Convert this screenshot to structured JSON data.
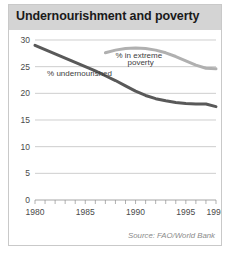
{
  "panel": {
    "title": "Undernourishment and poverty",
    "source": "Source: FAO/World Bank"
  },
  "chart_data": {
    "type": "line",
    "title": "Undernourishment and poverty",
    "xlabel": "",
    "ylabel": "",
    "xlim": [
      1980,
      1998
    ],
    "ylim": [
      0,
      30
    ],
    "yticks": [
      0,
      5,
      10,
      15,
      20,
      25,
      30
    ],
    "ytick_labels": [
      "0",
      "5",
      "10",
      "15",
      "20",
      "25",
      "30"
    ],
    "xticks": [
      1980,
      1985,
      1990,
      1995,
      1998
    ],
    "xtick_labels": [
      "1980",
      "1985",
      "1990",
      "1995",
      "1998"
    ],
    "minor_xticks": [
      1980,
      1981,
      1982,
      1983,
      1984,
      1985,
      1986,
      1987,
      1988,
      1989,
      1990,
      1991,
      1992,
      1993,
      1994,
      1995,
      1996,
      1997,
      1998
    ],
    "grid": "horizontal",
    "legend": "inline-labels",
    "series": [
      {
        "name": "% undernourished",
        "label": "% undernourished",
        "color": "#595959",
        "x": [
          1980,
          1981,
          1982,
          1983,
          1984,
          1985,
          1986,
          1987,
          1988,
          1989,
          1990,
          1991,
          1992,
          1993,
          1994,
          1995,
          1996,
          1997,
          1998
        ],
        "values": [
          29.0,
          28.2,
          27.4,
          26.6,
          25.8,
          25.0,
          24.2,
          23.3,
          22.4,
          21.4,
          20.4,
          19.6,
          19.0,
          18.6,
          18.3,
          18.1,
          18.0,
          18.0,
          17.5
        ]
      },
      {
        "name": "% in extreme poverty",
        "label": "% in extreme poverty",
        "color": "#b0b0b0",
        "x": [
          1987,
          1988,
          1989,
          1990,
          1991,
          1992,
          1993,
          1994,
          1995,
          1996,
          1997,
          1998
        ],
        "values": [
          27.6,
          28.1,
          28.4,
          28.5,
          28.4,
          28.1,
          27.6,
          26.9,
          26.1,
          25.3,
          24.7,
          24.6
        ]
      }
    ],
    "annotations": [
      {
        "text": "% in extreme",
        "x": 1988.0,
        "y": 26.6
      },
      {
        "text": "poverty",
        "x": 1989.2,
        "y": 25.3
      },
      {
        "text": "% undernourished",
        "x": 1981.2,
        "y": 23.3
      }
    ],
    "source": "Source: FAO/World Bank"
  }
}
